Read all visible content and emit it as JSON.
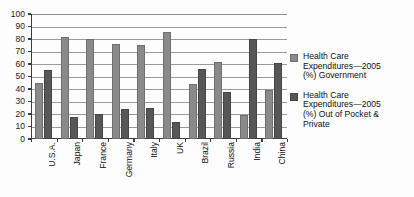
{
  "chart_data": {
    "type": "bar",
    "title": "",
    "xlabel": "",
    "ylabel": "",
    "ylim": [
      0,
      100
    ],
    "ytick_step": 10,
    "ytick_labels": [
      "100",
      "90",
      "80",
      "70",
      "60",
      "50",
      "40",
      "30",
      "20",
      "10",
      "0"
    ],
    "grid": true,
    "legend_position": "right",
    "categories": [
      "U.S.A.",
      "Japan",
      "France",
      "Germany",
      "Italy",
      "UK",
      "Brazil",
      "Russia",
      "India",
      "China"
    ],
    "series": [
      {
        "name": "Health Care Expenditures—2005 (%) Government",
        "color": "#8a8a8a",
        "values": [
          45,
          82,
          80,
          76,
          75,
          86,
          44,
          62,
          19,
          39
        ]
      },
      {
        "name": "Health Care Expenditures—2005 (%) Out of Pocket & Private",
        "color": "#575757",
        "values": [
          55,
          18,
          20,
          24,
          25,
          14,
          56,
          38,
          80,
          61
        ]
      }
    ]
  },
  "legend": {
    "entries": [
      {
        "label": "Health Care\nExpenditures—2005\n(%) Government",
        "color": "#8a8a8a"
      },
      {
        "label": "Health Care\nExpenditures—2005\n(%) Out of Pocket &\nPrivate",
        "color": "#575757"
      }
    ]
  }
}
